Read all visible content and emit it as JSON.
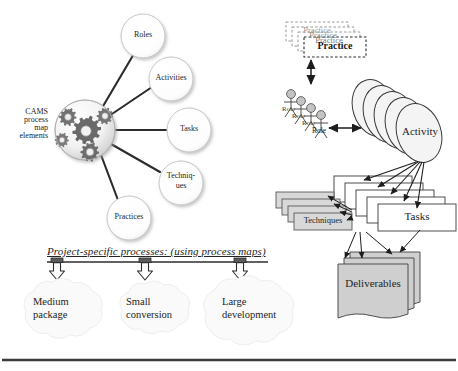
{
  "figure": {
    "title": "CAMS process map elements",
    "bottom_rule_color": "#3a3a3a"
  },
  "left_panel": {
    "hub": {
      "name": "gear-globe",
      "label_lines": [
        "CAMS",
        "process",
        "map",
        "elements"
      ],
      "label_text": "CAMS\nprocess\nmap\nelements"
    },
    "nodes": [
      {
        "id": "roles",
        "label": "Roles"
      },
      {
        "id": "activities",
        "label": "Activities"
      },
      {
        "id": "tasks",
        "label": "Tasks"
      },
      {
        "id": "techniques",
        "label": "Techniq-\nues",
        "line1": "Techniq-",
        "line2": "ues"
      },
      {
        "id": "practices",
        "label": "Practices"
      }
    ]
  },
  "processes_band": {
    "caption": "Project-specific processes: (using process maps)",
    "clouds": [
      {
        "id": "medium-package",
        "label": "Medium\npackage",
        "line1": "Medium",
        "line2": "package"
      },
      {
        "id": "small-conversion",
        "label": "Small\nconversion",
        "line1": "Small",
        "line2": "conversion"
      },
      {
        "id": "large-development",
        "label": "Large\ndevelopment",
        "line1": "Large",
        "line2": "development"
      }
    ]
  },
  "right_panel": {
    "practice_stack": {
      "id": "practice",
      "count": 4,
      "labels": [
        "Practice",
        "Practice",
        "Practice",
        "Practice"
      ],
      "front_label": "Practice",
      "border_style": "dashed"
    },
    "role_stack": {
      "id": "role",
      "count": 4,
      "labels": [
        "Role",
        "Role",
        "Role",
        "Role"
      ],
      "front_label": "Role",
      "glyph": "stick-figure"
    },
    "activity_stack": {
      "id": "activity",
      "count": 5,
      "front_label": "Activity",
      "shape": "ellipse-cylinder"
    },
    "tasks_stack": {
      "id": "tasks",
      "count": 5,
      "front_label": "Tasks",
      "shape": "rectangle"
    },
    "techniques_stack": {
      "id": "techniques",
      "count": 4,
      "front_label": "Techniques",
      "shape": "rectangle",
      "fill": "#d8d8d8"
    },
    "deliverables_stack": {
      "id": "deliverables",
      "count": 3,
      "front_label": "Deliverables",
      "shape": "document",
      "fill": "#d0d0d0"
    }
  },
  "colors": {
    "stroke": "#4a4a4a",
    "dark_stroke": "#111111",
    "node_fill": "#ffffff",
    "gray_fill": "#d6d6d6",
    "cloud_fill": "#fbfbfb",
    "text": "#242424"
  }
}
